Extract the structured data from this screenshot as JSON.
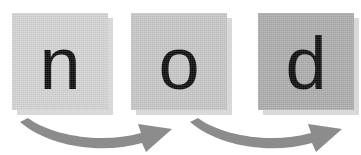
{
  "scene": {
    "title": "nod",
    "description": "Three letter tiles spelling the word nod with curved blending arrows beneath",
    "background_color": "#ffffff",
    "width": 361,
    "height": 155
  },
  "tiles": [
    {
      "letter": "n",
      "icon_name": "letter-tile-n",
      "fill_color": "#d2d2d2",
      "shadow_color": "#d9d9d9",
      "text_color": "#080808",
      "position": 1
    },
    {
      "letter": "o",
      "icon_name": "letter-tile-o",
      "fill_color": "#c6c6c6",
      "shadow_color": "#d9d9d9",
      "text_color": "#080808",
      "position": 2
    },
    {
      "letter": "d",
      "icon_name": "letter-tile-d",
      "fill_color": "#ababab",
      "shadow_color": "#d9d9d9",
      "text_color": "#080808",
      "position": 3
    }
  ],
  "arrows": [
    {
      "icon_name": "curved-blend-arrow",
      "direction": "left-to-right",
      "color": "#8c8c8c",
      "from_tile": "n",
      "to_tile": "o"
    },
    {
      "icon_name": "curved-blend-arrow",
      "direction": "left-to-right",
      "color": "#8c8c8c",
      "from_tile": "o",
      "to_tile": "d"
    }
  ]
}
